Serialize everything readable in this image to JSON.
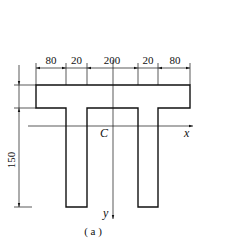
{
  "figure": {
    "caption": "( a )",
    "centroid_label": "C",
    "axis_x_label": "x",
    "axis_y_label": "y"
  },
  "dimensions": {
    "top": [
      {
        "label": "80",
        "x1": 36,
        "x2": 66
      },
      {
        "label": "20",
        "x1": 66,
        "x2": 87
      },
      {
        "label": "200",
        "x1": 87,
        "x2": 138
      },
      {
        "label": "20",
        "x1": 138,
        "x2": 158
      },
      {
        "label": "80",
        "x1": 158,
        "x2": 190
      }
    ],
    "left_height": {
      "label": "150"
    }
  },
  "colors": {
    "line": "#111111",
    "background": "#ffffff"
  }
}
